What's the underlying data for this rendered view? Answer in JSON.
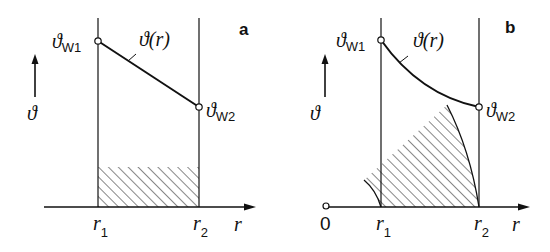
{
  "figure": {
    "panels": [
      {
        "id": "a",
        "panel_label": "a",
        "y_axis_symbol": "ϑ",
        "x_axis_symbol": "r",
        "curve_label": "ϑ(r)",
        "curve_shape": "linear",
        "wall_inner_label": {
          "main": "ϑ",
          "sub": "W1"
        },
        "wall_outer_label": {
          "main": "ϑ",
          "sub": "W2"
        },
        "r1_label": {
          "main": "r",
          "sub": "1"
        },
        "r2_label": {
          "main": "r",
          "sub": "2"
        },
        "hatched_region": "rectangular plane wall cross-section"
      },
      {
        "id": "b",
        "panel_label": "b",
        "y_axis_symbol": "ϑ",
        "x_axis_symbol": "r",
        "origin_label": "0",
        "curve_label": "ϑ(r)",
        "curve_shape": "logarithmic",
        "wall_inner_label": {
          "main": "ϑ",
          "sub": "W1"
        },
        "wall_outer_label": {
          "main": "ϑ",
          "sub": "W2"
        },
        "r1_label": {
          "main": "r",
          "sub": "1"
        },
        "r2_label": {
          "main": "r",
          "sub": "2"
        },
        "hatched_region": "curved cylindrical wall cross-section"
      }
    ]
  },
  "colors": {
    "ink": "#111111",
    "background": "#ffffff"
  }
}
